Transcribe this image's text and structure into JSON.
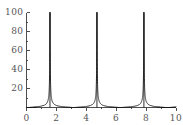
{
  "chart_data": {
    "type": "line",
    "title": "",
    "subtitle": "",
    "xlabel": "",
    "ylabel": "",
    "xlim": [
      0,
      10
    ],
    "ylim": [
      0,
      100
    ],
    "grid": false,
    "legend": null,
    "legend_position": "none",
    "xticks": [
      0,
      2,
      4,
      6,
      8,
      10
    ],
    "xtick_labels": [
      "0",
      "2",
      "4",
      "6",
      "8",
      "10"
    ],
    "yticks": [
      20,
      40,
      60,
      80,
      100
    ],
    "ytick_labels": [
      "20",
      "40",
      "60",
      "80",
      "100"
    ],
    "axis_color": "#4d4d4d",
    "curve_color": "#1a1a1a",
    "background_color": "#ffffff",
    "asymptotes": [
      1.5708,
      4.7124,
      7.854
    ],
    "series": [
      {
        "name": "tan-like curve",
        "function": "|tan(x)| clipped at 100",
        "period": 3.1416,
        "points_x": [
          0.0,
          0.2,
          0.4,
          0.6,
          0.8,
          1.0,
          1.1,
          1.2,
          1.3,
          1.4,
          1.45,
          1.5,
          1.53,
          1.55,
          1.56,
          1.5708,
          1.58,
          1.6,
          1.62,
          1.65,
          1.7,
          1.8,
          2.0,
          2.2,
          2.4,
          2.6,
          2.8,
          3.0,
          3.2,
          3.4,
          3.6,
          3.8,
          4.0,
          4.2,
          4.4,
          4.5,
          4.6,
          4.65,
          4.68,
          4.7,
          4.7124,
          4.73,
          4.75,
          4.8,
          4.9,
          5.0,
          5.2,
          5.5,
          6.0,
          6.5,
          7.0,
          7.3,
          7.5,
          7.65,
          7.75,
          7.8,
          7.83,
          7.85,
          7.854,
          7.87,
          7.9,
          7.95,
          8.0,
          8.2,
          8.5,
          9.0,
          9.5,
          10.0
        ],
        "points_y": [
          0,
          0.2,
          0.42,
          0.68,
          1.03,
          1.56,
          1.96,
          2.57,
          3.6,
          5.8,
          8.0,
          14.1,
          25.5,
          48.1,
          92.6,
          100,
          100,
          100,
          100,
          43.5,
          7.7,
          4.3,
          2.19,
          1.37,
          0.92,
          0.6,
          0.36,
          0.14,
          0.06,
          0.26,
          0.49,
          0.77,
          1.16,
          1.78,
          3.0,
          4.6,
          8.5,
          14.3,
          24.0,
          80,
          100,
          100,
          100,
          25.5,
          8.3,
          4.4,
          2.1,
          1.2,
          0.3,
          0.4,
          1.0,
          1.9,
          3.0,
          5.5,
          13.0,
          30.0,
          70,
          100,
          100,
          100,
          100,
          100,
          25.0,
          8.0,
          3.2,
          1.3,
          0.5,
          0.3
        ]
      }
    ]
  },
  "axes": {
    "x_axis_name": "x-axis",
    "y_axis_name": "y-axis"
  }
}
